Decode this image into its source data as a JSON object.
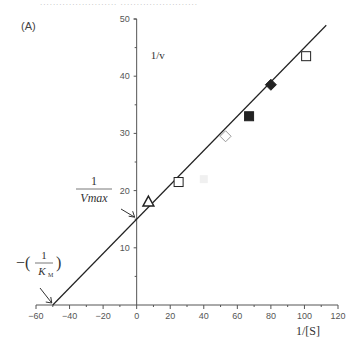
{
  "header": {
    "partial_text": "........................ ........................"
  },
  "panel_label": "(A)",
  "annotations": {
    "vmax_numerator": "1",
    "vmax_denominator": "Vmax",
    "km_prefix": "−(",
    "km_numerator": "1",
    "km_denominator": "K",
    "km_subscript": "M",
    "km_suffix": ")"
  },
  "chart_data": {
    "type": "scatter",
    "title": "(A)",
    "subtitle": "Lineweaver–Burk double-reciprocal plot",
    "xlabel": "1/[S]",
    "ylabel": "1/v",
    "xlim": [
      -60,
      120
    ],
    "ylim": [
      0,
      50
    ],
    "x_ticks": [
      -60,
      -40,
      -20,
      0,
      20,
      40,
      60,
      80,
      100,
      120
    ],
    "y_ticks": [
      10,
      20,
      30,
      40,
      50
    ],
    "grid": false,
    "legend": null,
    "series": [
      {
        "name": "open-triangle",
        "marker": "triangle-open",
        "points": [
          [
            7,
            18
          ]
        ]
      },
      {
        "name": "open-square",
        "marker": "square-open",
        "points": [
          [
            25,
            21.5
          ],
          [
            101,
            43.5
          ]
        ]
      },
      {
        "name": "open-diamond",
        "marker": "diamond-open",
        "points": [
          [
            53,
            29.5
          ]
        ]
      },
      {
        "name": "filled-square",
        "marker": "square-filled",
        "points": [
          [
            67,
            33
          ]
        ]
      },
      {
        "name": "filled-diamond",
        "marker": "diamond-filled",
        "points": [
          [
            80,
            38.5
          ]
        ]
      }
    ],
    "fit_line": {
      "x_intercept": -50,
      "y_intercept": 15,
      "slope": 0.3,
      "x_range": [
        -50,
        113
      ]
    },
    "annotations": [
      {
        "text": "1/Vmax",
        "points_to": [
          0,
          15
        ]
      },
      {
        "text": "−(1/K_M)",
        "points_to": [
          -50,
          0
        ]
      }
    ]
  }
}
